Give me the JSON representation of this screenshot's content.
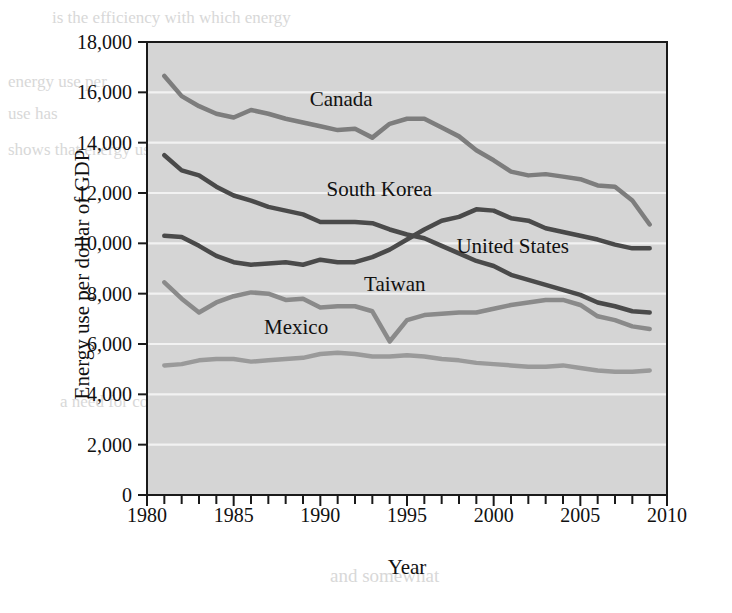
{
  "figure": {
    "plot_background": "#d5d5d5",
    "gridline_color": "#f2f2f2",
    "frame_color": "#1a1a1a"
  },
  "source_note": "Data are from the Energy Information Administration, http://www.eia.doe.gov.",
  "chart_data": {
    "type": "line",
    "title": "",
    "xlabel": "Year",
    "ylabel": "Energy use per dollar of GDP",
    "xlim": [
      1980,
      2010
    ],
    "ylim": [
      0,
      18000
    ],
    "xticks": [
      1980,
      1985,
      1990,
      1995,
      2000,
      2005,
      2010
    ],
    "xtick_labels": [
      "1980",
      "1985",
      "1990",
      "1995",
      "2000",
      "2005",
      "2010"
    ],
    "xminor_step": 1,
    "yticks": [
      0,
      2000,
      4000,
      6000,
      8000,
      10000,
      12000,
      14000,
      16000,
      18000
    ],
    "ytick_labels": [
      "0",
      "2,000",
      "4,000",
      "6,000",
      "8,000",
      "10,000",
      "12,000",
      "14,000",
      "16,000",
      "18,000"
    ],
    "grid": true,
    "grid_axis": "y",
    "legend": "inline-annotations",
    "x": [
      1981,
      1982,
      1983,
      1984,
      1985,
      1986,
      1987,
      1988,
      1989,
      1990,
      1991,
      1992,
      1993,
      1994,
      1995,
      1996,
      1997,
      1998,
      1999,
      2000,
      2001,
      2002,
      2003,
      2004,
      2005,
      2006,
      2007,
      2008,
      2009
    ],
    "series": [
      {
        "name": "Canada",
        "color": "#7d7d7d",
        "width": 4.5,
        "label_x": 1991.2,
        "label_y": 15450,
        "values": [
          16650,
          15850,
          15450,
          15150,
          15000,
          15300,
          15150,
          14950,
          14800,
          14650,
          14500,
          14550,
          14200,
          14750,
          14950,
          14950,
          14600,
          14250,
          13700,
          13300,
          12850,
          12700,
          12750,
          12650,
          12550,
          12300,
          12250,
          11700,
          10750
        ]
      },
      {
        "name": "South Korea",
        "color": "#4a4a4a",
        "width": 4.5,
        "label_x": 1993.4,
        "label_y": 11900,
        "values": [
          10300,
          10250,
          9900,
          9500,
          9250,
          9150,
          9200,
          9250,
          9150,
          9350,
          9250,
          9250,
          9450,
          9750,
          10150,
          10550,
          10900,
          11050,
          11350,
          11300,
          11000,
          10900,
          10600,
          10450,
          10300,
          10150,
          9950,
          9800,
          9800
        ]
      },
      {
        "name": "United States",
        "color": "#4a4a4a",
        "width": 4.5,
        "label_x": 2001.1,
        "label_y": 9600,
        "values": [
          13500,
          12900,
          12700,
          12250,
          11900,
          11700,
          11450,
          11300,
          11150,
          10850,
          10850,
          10850,
          10800,
          10550,
          10350,
          10200,
          9900,
          9600,
          9300,
          9100,
          8750,
          8550,
          8350,
          8150,
          7950,
          7650,
          7500,
          7300,
          7250
        ]
      },
      {
        "name": "Taiwan",
        "color": "#8a8a8a",
        "width": 4.5,
        "label_x": 1994.3,
        "label_y": 8100,
        "values": [
          8450,
          7800,
          7250,
          7650,
          7900,
          8050,
          8000,
          7750,
          7800,
          7450,
          7500,
          7500,
          7300,
          6100,
          6950,
          7150,
          7200,
          7250,
          7250,
          7400,
          7550,
          7650,
          7750,
          7750,
          7550,
          7100,
          6950,
          6700,
          6600
        ]
      },
      {
        "name": "Mexico",
        "color": "#9a9a9a",
        "width": 4.5,
        "label_x": 1988.6,
        "label_y": 6400,
        "values": [
          5150,
          5200,
          5350,
          5400,
          5400,
          5300,
          5350,
          5400,
          5450,
          5600,
          5650,
          5600,
          5500,
          5500,
          5550,
          5500,
          5400,
          5350,
          5250,
          5200,
          5150,
          5100,
          5100,
          5150,
          5050,
          4950,
          4900,
          4900,
          4950
        ]
      }
    ]
  },
  "bleed_text": [
    {
      "text": "is the efficiency with which energy",
      "x": 52,
      "y": 8,
      "size": 17
    },
    {
      "text": "energy use per",
      "x": 8,
      "y": 72,
      "size": 17
    },
    {
      "text": "use has",
      "x": 8,
      "y": 104,
      "size": 17
    },
    {
      "text": "shows that energy use per",
      "x": 8,
      "y": 140,
      "size": 17
    },
    {
      "text": "at the same time",
      "x": 400,
      "y": 330,
      "size": 17
    },
    {
      "text": "a need for conservation",
      "x": 60,
      "y": 392,
      "size": 17
    },
    {
      "text": "and somewhat",
      "x": 330,
      "y": 565,
      "size": 19
    }
  ]
}
